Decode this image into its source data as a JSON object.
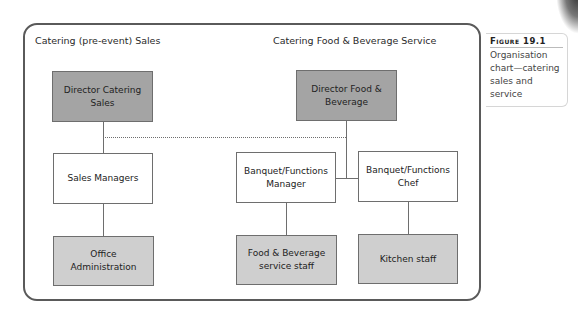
{
  "sections": {
    "left_title": "Catering (pre-event) Sales",
    "right_title": "Catering Food & Beverage Service"
  },
  "nodes": {
    "director_catering_sales": "Director Catering Sales",
    "sales_managers": "Sales Managers",
    "office_administration": "Office Administration",
    "director_food_beverage": "Director Food & Beverage",
    "banquet_manager": "Banquet/Functions Manager",
    "banquet_chef": "Banquet/Functions Chef",
    "fb_service_staff": "Food & Beverage service staff",
    "kitchen_staff": "Kitchen staff"
  },
  "caption": {
    "label": "Figure 19.1",
    "text": "Organisation chart—catering sales and service"
  },
  "colors": {
    "director_fill": "#a4a4a4",
    "manager_fill": "#ffffff",
    "staff_fill": "#cfcfcf",
    "line": "#6e6e6e",
    "frame": "#5a5a5a"
  },
  "edges": [
    {
      "from": "director_catering_sales",
      "to": "sales_managers",
      "style": "solid"
    },
    {
      "from": "sales_managers",
      "to": "office_administration",
      "style": "solid"
    },
    {
      "from": "director_food_beverage",
      "to": "banquet_manager",
      "style": "solid"
    },
    {
      "from": "director_food_beverage",
      "to": "banquet_chef",
      "style": "solid"
    },
    {
      "from": "banquet_manager",
      "to": "fb_service_staff",
      "style": "solid"
    },
    {
      "from": "banquet_chef",
      "to": "kitchen_staff",
      "style": "solid"
    },
    {
      "from": "director_catering_sales",
      "to": "director_food_beverage",
      "style": "dotted"
    }
  ]
}
